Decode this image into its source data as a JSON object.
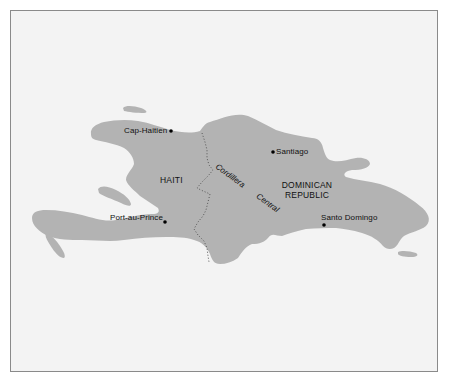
{
  "map": {
    "region": "Hispaniola",
    "colors": {
      "background": "#f3f3f3",
      "land": "#b3b3b3",
      "frame_border": "#8a8a8a",
      "city_dot": "#000000",
      "border_line": "#555555"
    },
    "countries": [
      {
        "name": "HAITI"
      },
      {
        "name_line1": "DOMINICAN",
        "name_line2": "REPUBLIC"
      }
    ],
    "cities": [
      {
        "name": "Cap-Haitien"
      },
      {
        "name": "Santiago"
      },
      {
        "name": "Port-au-Prince"
      },
      {
        "name": "Santo Domingo"
      }
    ],
    "features": [
      {
        "name": "Cordillera Central",
        "type": "mountain-range"
      }
    ]
  }
}
